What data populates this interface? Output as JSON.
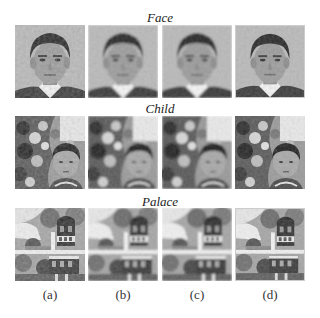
{
  "figure": {
    "rows": [
      {
        "title": "Face",
        "kind": "face"
      },
      {
        "title": "Child",
        "kind": "child"
      },
      {
        "title": "Palace",
        "kind": "palace"
      }
    ],
    "column_labels": [
      "(a)",
      "(b)",
      "(c)",
      "(d)"
    ]
  }
}
